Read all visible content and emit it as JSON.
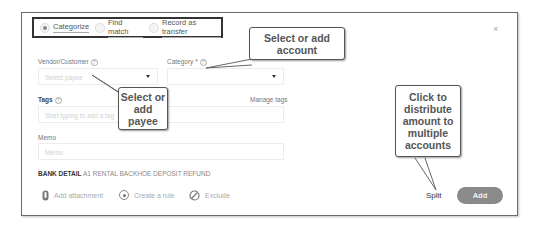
{
  "tabs": {
    "options": [
      {
        "label": "Categorize",
        "selected": true
      },
      {
        "label": "Find match",
        "selected": false
      },
      {
        "label": "Record as transfer",
        "selected": false
      }
    ]
  },
  "form": {
    "vendor_label": "Vendor/Customer",
    "vendor_placeholder": "Select payee",
    "category_label": "Category *",
    "category_value": "",
    "tags_label": "Tags",
    "manage_tags": "Manage tags",
    "tags_placeholder": "Start typing to add a tag",
    "memo_label": "Memo",
    "memo_placeholder": "Memo"
  },
  "bank_detail": {
    "label": "BANK DETAIL",
    "value": "A1 RENTAL BACKHOE DEPOSIT REFUND"
  },
  "actions": {
    "attachment": "Add attachment",
    "rule": "Create a rule",
    "exclude": "Exclude",
    "split": "Split",
    "add": "Add",
    "close": "×"
  },
  "callouts": {
    "account": "Select or add account",
    "payee": "Select or add payee",
    "split": "Click to distribute amount to multiple accounts"
  }
}
